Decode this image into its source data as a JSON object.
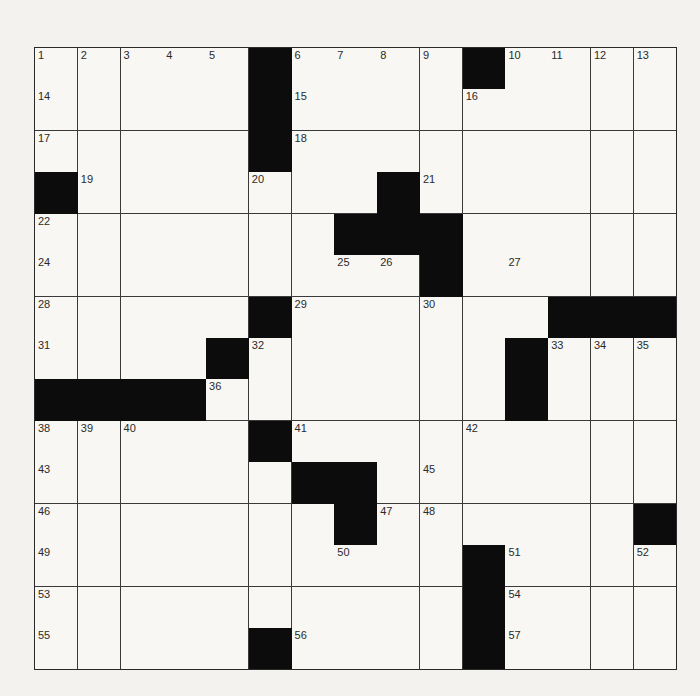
{
  "puzzle": {
    "size": 15,
    "rows": [
      ".....#....#....",
      ".....#.........",
      ".....#.........",
      "#.......#......",
      ".......###.....",
      ".........#.....",
      ".....#......###",
      "....#......#...",
      "####.......#...",
      ".....#.........",
      "......##.......",
      ".......#......#",
      "..........#....",
      "..........#....",
      ".....#....#...."
    ],
    "numbers": [
      [
        1,
        2,
        3,
        4,
        5,
        0,
        6,
        7,
        8,
        9,
        0,
        10,
        11,
        12,
        13
      ],
      [
        14,
        0,
        0,
        0,
        0,
        0,
        15,
        0,
        0,
        0,
        16,
        0,
        0,
        0,
        0
      ],
      [
        17,
        0,
        0,
        0,
        0,
        0,
        18,
        0,
        0,
        0,
        0,
        0,
        0,
        0,
        0
      ],
      [
        0,
        19,
        0,
        0,
        0,
        20,
        0,
        0,
        0,
        21,
        0,
        0,
        0,
        0,
        0
      ],
      [
        22,
        0,
        0,
        0,
        0,
        0,
        0,
        0,
        0,
        23,
        0,
        0,
        0,
        0,
        0
      ],
      [
        24,
        0,
        0,
        0,
        0,
        0,
        0,
        25,
        26,
        0,
        0,
        27,
        0,
        0,
        0
      ],
      [
        28,
        0,
        0,
        0,
        0,
        0,
        29,
        0,
        0,
        30,
        0,
        0,
        0,
        0,
        0
      ],
      [
        31,
        0,
        0,
        0,
        0,
        32,
        0,
        0,
        0,
        0,
        0,
        0,
        33,
        34,
        35
      ],
      [
        0,
        0,
        0,
        0,
        36,
        0,
        0,
        0,
        0,
        0,
        0,
        37,
        0,
        0,
        0
      ],
      [
        38,
        39,
        40,
        0,
        0,
        0,
        41,
        0,
        0,
        0,
        42,
        0,
        0,
        0,
        0
      ],
      [
        43,
        0,
        0,
        0,
        0,
        0,
        44,
        0,
        0,
        45,
        0,
        0,
        0,
        0,
        0
      ],
      [
        46,
        0,
        0,
        0,
        0,
        0,
        0,
        0,
        47,
        48,
        0,
        0,
        0,
        0,
        0
      ],
      [
        49,
        0,
        0,
        0,
        0,
        0,
        0,
        50,
        0,
        0,
        0,
        51,
        0,
        0,
        52
      ],
      [
        53,
        0,
        0,
        0,
        0,
        0,
        0,
        0,
        0,
        0,
        0,
        54,
        0,
        0,
        0
      ],
      [
        55,
        0,
        0,
        0,
        0,
        0,
        56,
        0,
        0,
        0,
        0,
        57,
        0,
        0,
        0
      ]
    ],
    "letters": [],
    "colors": {
      "black": "#0c0c0c",
      "white": "#f8f7f3",
      "line": "#3a3a3a",
      "paper": "#f3f2ee"
    }
  }
}
